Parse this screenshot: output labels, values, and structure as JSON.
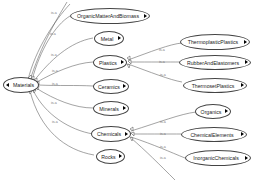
{
  "diagram": {
    "type": "concept-hierarchy",
    "edge_label": "is-a",
    "root": {
      "label": "Materials"
    },
    "children": [
      {
        "label": "OrganicMatterAndBiomass"
      },
      {
        "label": "Metal"
      },
      {
        "label": "Plastics",
        "children": [
          {
            "label": "ThermoplasticPlastics"
          },
          {
            "label": "RubberAndElastomers"
          },
          {
            "label": "ThermosetPlastics"
          }
        ]
      },
      {
        "label": "Ceramics"
      },
      {
        "label": "Minerals"
      },
      {
        "label": "Chemicals",
        "children": [
          {
            "label": "Organics"
          },
          {
            "label": "ChemicalElements"
          },
          {
            "label": "InorganicChemicals"
          }
        ]
      },
      {
        "label": "Rocks"
      }
    ],
    "colors": {
      "edge": "#555555",
      "node_border": "#444444",
      "background": "#ffffff"
    }
  }
}
